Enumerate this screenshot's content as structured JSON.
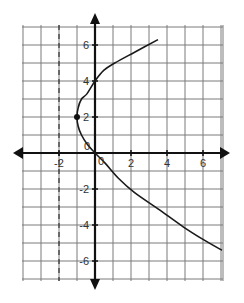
{
  "chart_data": {
    "type": "line",
    "title": "",
    "xlabel": "",
    "ylabel": "",
    "grid": true,
    "legend": null,
    "xlim": [
      -4,
      7.1
    ],
    "ylim": [
      -7,
      7
    ],
    "x_ticks": [
      {
        "value": -2,
        "label": "-2"
      },
      {
        "value": 0,
        "label": "0"
      },
      {
        "value": 2,
        "label": "2"
      },
      {
        "value": 4,
        "label": "4"
      },
      {
        "value": 6,
        "label": "6"
      }
    ],
    "y_ticks": [
      {
        "value": 6,
        "label": "6"
      },
      {
        "value": 4,
        "label": "4"
      },
      {
        "value": 2,
        "label": "2"
      },
      {
        "value": 0,
        "label": "0"
      },
      {
        "value": -2,
        "label": "-2"
      },
      {
        "value": -4,
        "label": "-4"
      },
      {
        "value": -6,
        "label": "-6"
      }
    ],
    "series": [
      {
        "name": "curve",
        "description": "sideways parabola-like curve opening to the right, vertex at (-1, 2)",
        "points": [
          [
            3.5,
            6.3
          ],
          [
            2.2,
            5.6
          ],
          [
            1.1,
            5.0
          ],
          [
            0.5,
            4.6
          ],
          [
            0,
            4.0
          ],
          [
            -0.44,
            3.3
          ],
          [
            -0.75,
            3.0
          ],
          [
            -0.94,
            2.5
          ],
          [
            -1,
            2.0
          ],
          [
            -0.94,
            1.5
          ],
          [
            -0.75,
            1.0
          ],
          [
            -0.44,
            0.5
          ],
          [
            0,
            0
          ],
          [
            0.56,
            -0.56
          ],
          [
            1.3,
            -1.4
          ],
          [
            2.2,
            -2.2
          ],
          [
            3.5,
            -3.1
          ],
          [
            4.9,
            -4.1
          ],
          [
            6.0,
            -4.8
          ],
          [
            7.05,
            -5.4
          ]
        ]
      }
    ],
    "annotations": [
      {
        "type": "point",
        "x": -1,
        "y": 2,
        "label": "vertex dot"
      },
      {
        "type": "vline-dashed",
        "x": -2,
        "label": "dashed vertical line x = -2"
      }
    ]
  },
  "labels": {
    "origin_upper": "0",
    "origin_lower": "0"
  }
}
